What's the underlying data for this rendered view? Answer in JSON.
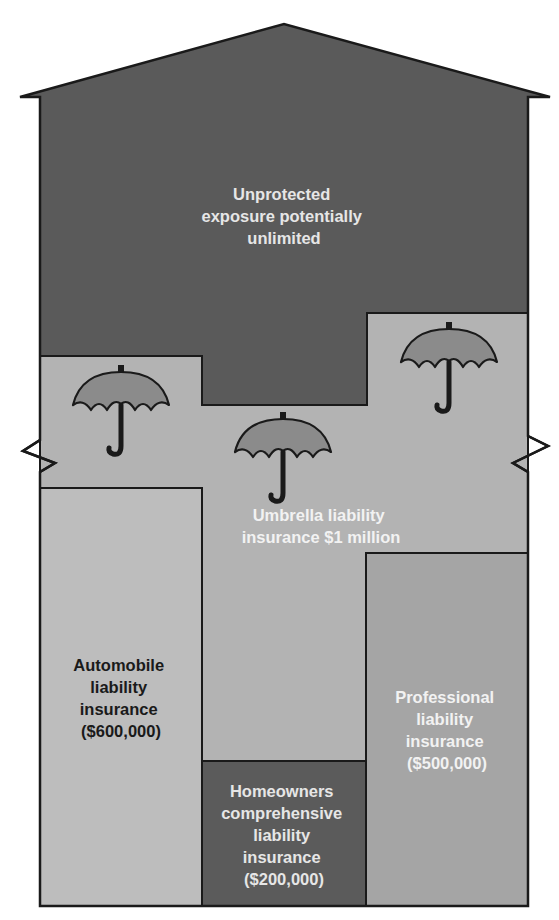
{
  "diagram": {
    "type": "house-coverage-diagram",
    "colors": {
      "unprotected_fill": "#5a5a5a",
      "umbrella_band_fill": "#b3b3b3",
      "automobile_fill": "#bdbdbd",
      "professional_fill": "#a5a5a5",
      "homeowners_fill": "#5b5b5b",
      "umbrella_canopy_fill": "#8b8b8b",
      "outline": "#1a1a1a",
      "light_text": "#e6e6e6",
      "dark_text": "#1a1a1a"
    },
    "regions": {
      "unprotected": {
        "lines": [
          "Unprotected",
          "exposure potentially",
          "unlimited"
        ]
      },
      "umbrella": {
        "lines": [
          "Umbrella liability",
          "insurance $1 million"
        ],
        "icon_count": 3
      },
      "automobile": {
        "lines": [
          "Automobile",
          "liability",
          "insurance",
          "($600,000)"
        ]
      },
      "homeowners": {
        "lines": [
          "Homeowners",
          "comprehensive",
          "liability",
          "insurance",
          "($200,000)"
        ]
      },
      "professional": {
        "lines": [
          "Professional",
          "liability",
          "insurance",
          "($500,000)"
        ]
      }
    }
  }
}
